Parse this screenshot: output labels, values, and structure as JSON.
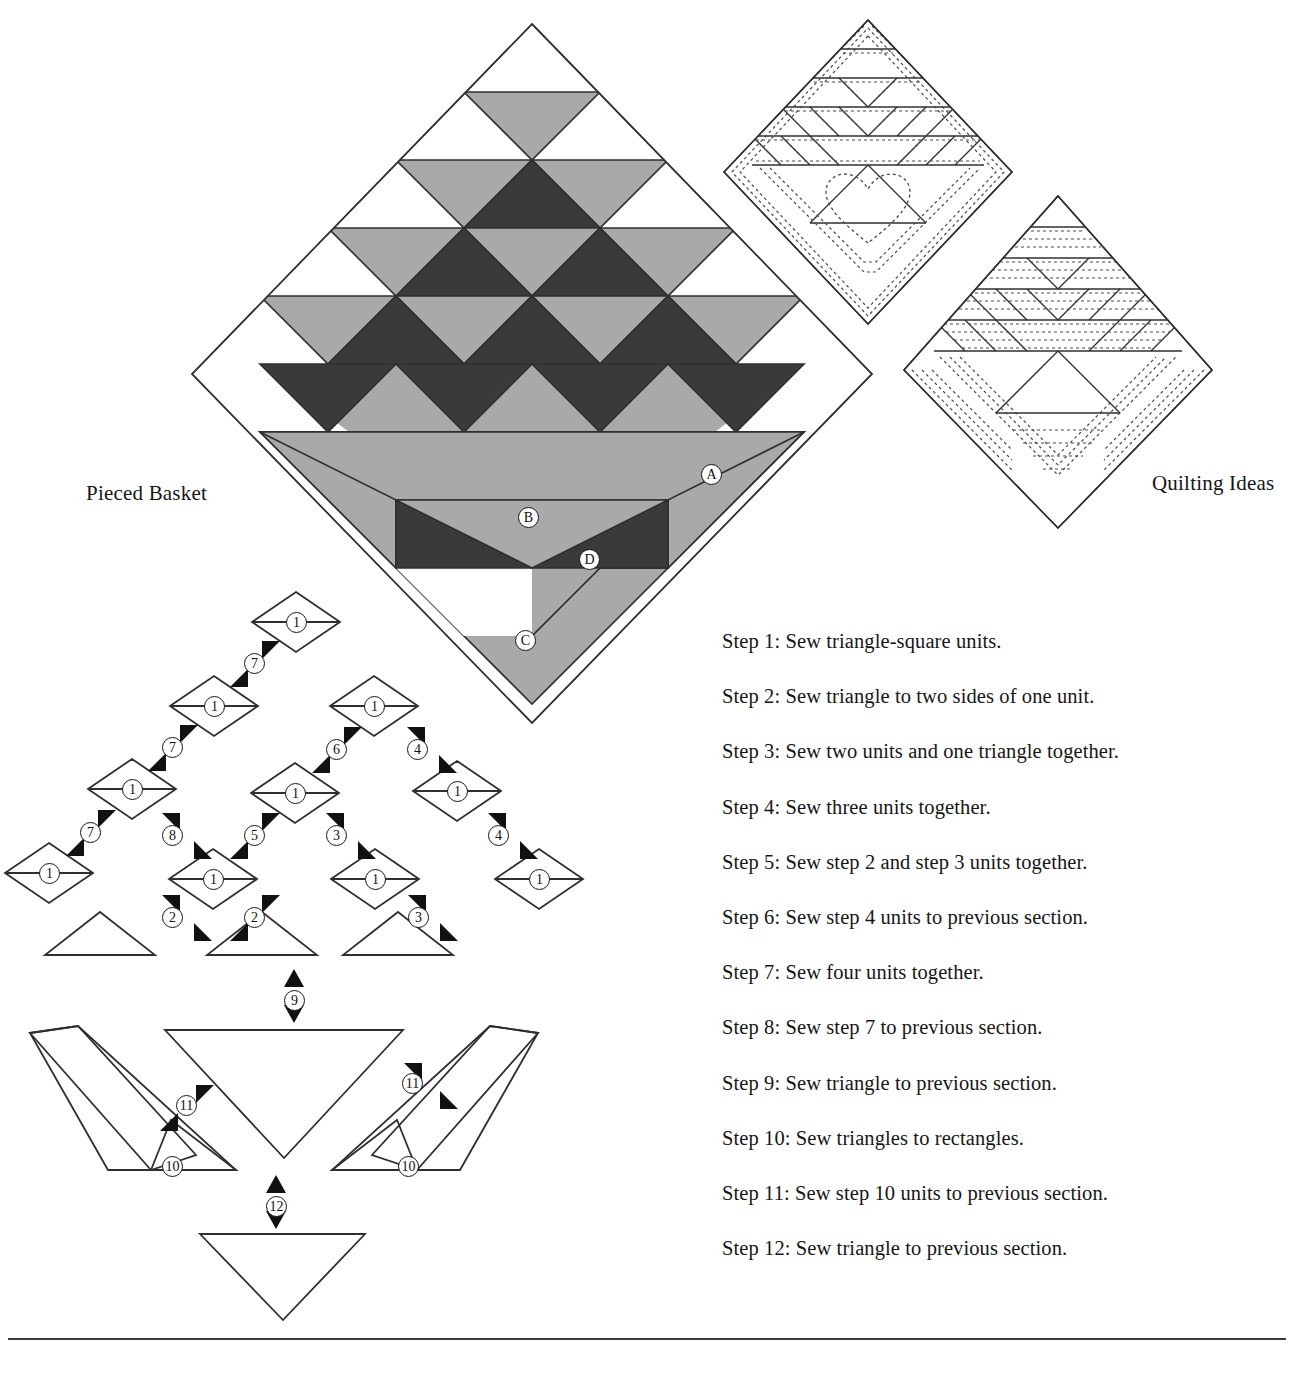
{
  "page": {
    "background": "#ffffff",
    "ink": "#161616"
  },
  "labels": {
    "pieced_basket": "Pieced Basket",
    "quilting_ideas": "Quilting Ideas"
  },
  "block_patch_labels": [
    {
      "id": "A",
      "text": "A",
      "x": 708,
      "y": 465,
      "note": "background corner triangle"
    },
    {
      "id": "B",
      "text": "B",
      "x": 521,
      "y": 508,
      "note": "large light basket triangle"
    },
    {
      "id": "C",
      "text": "C",
      "x": 521,
      "y": 633,
      "note": "bottom background triangle"
    },
    {
      "id": "D",
      "text": "D",
      "x": 586,
      "y": 551,
      "note": "dark basket foot triangle"
    }
  ],
  "colors": {
    "light_fabric": "#a9a9a9",
    "dark_fabric": "#3a3a3a",
    "background_fabric": "#ffffff",
    "outline": "#2f2f2f",
    "quilting_dash": "#4a4a4a"
  },
  "steps": [
    {
      "n": 1,
      "label": "Step 1: Sew triangle-square units."
    },
    {
      "n": 2,
      "label": "Step 2: Sew triangle to two sides of one unit."
    },
    {
      "n": 3,
      "label": "Step 3: Sew two units and one triangle together."
    },
    {
      "n": 4,
      "label": "Step 4: Sew three units together."
    },
    {
      "n": 5,
      "label": "Step 5: Sew step 2 and step 3 units together."
    },
    {
      "n": 6,
      "label": "Step 6: Sew step 4 units to previous section."
    },
    {
      "n": 7,
      "label": "Step 7: Sew four units together."
    },
    {
      "n": 8,
      "label": "Step 8: Sew step 7 to previous section."
    },
    {
      "n": 9,
      "label": "Step 9: Sew triangle to previous section."
    },
    {
      "n": 10,
      "label": "Step 10: Sew triangles to rectangles."
    },
    {
      "n": 11,
      "label": "Step 11: Sew step 10 units to previous section."
    },
    {
      "n": 12,
      "label": "Step 12: Sew triangle to previous section."
    }
  ],
  "assembly": {
    "unit_label": "1",
    "units": [
      {
        "id": "u1",
        "x": 296,
        "y": 622
      },
      {
        "id": "u2",
        "x": 214,
        "y": 706
      },
      {
        "id": "u3",
        "x": 132,
        "y": 789
      },
      {
        "id": "u4",
        "x": 49,
        "y": 873
      },
      {
        "id": "u5",
        "x": 213,
        "y": 879
      },
      {
        "id": "u6",
        "x": 295,
        "y": 793
      },
      {
        "id": "u7",
        "x": 374,
        "y": 706
      },
      {
        "id": "u8",
        "x": 457,
        "y": 791
      },
      {
        "id": "u9",
        "x": 375,
        "y": 879
      },
      {
        "id": "u10",
        "x": 539,
        "y": 879
      }
    ],
    "seam_markers": [
      {
        "step": "7",
        "x": 254,
        "y": 663
      },
      {
        "step": "7",
        "x": 172,
        "y": 747
      },
      {
        "step": "7",
        "x": 90,
        "y": 832
      },
      {
        "step": "8",
        "x": 172,
        "y": 835
      },
      {
        "step": "2",
        "x": 172,
        "y": 917
      },
      {
        "step": "2",
        "x": 254,
        "y": 917
      },
      {
        "step": "5",
        "x": 254,
        "y": 835
      },
      {
        "step": "6",
        "x": 336,
        "y": 749
      },
      {
        "step": "3",
        "x": 336,
        "y": 835
      },
      {
        "step": "3",
        "x": 418,
        "y": 917
      },
      {
        "step": "4",
        "x": 417,
        "y": 749
      },
      {
        "step": "4",
        "x": 498,
        "y": 835
      },
      {
        "step": "9",
        "x": 294,
        "y": 1000
      },
      {
        "step": "11",
        "x": 186,
        "y": 1105
      },
      {
        "step": "11",
        "x": 412,
        "y": 1083
      },
      {
        "step": "10",
        "x": 172,
        "y": 1166
      },
      {
        "step": "10",
        "x": 408,
        "y": 1166
      },
      {
        "step": "12",
        "x": 276,
        "y": 1206
      }
    ],
    "loose_triangles": [
      {
        "id": "t1",
        "x": 100,
        "y": 912
      },
      {
        "id": "t2",
        "x": 262,
        "y": 912
      },
      {
        "id": "t3",
        "x": 398,
        "y": 912
      }
    ],
    "big_triangle": {
      "id": "basket-body",
      "x": 165,
      "y": 1026
    },
    "foot_triangle": {
      "id": "base-triangle",
      "x": 200,
      "y": 1230
    },
    "rectangles": [
      {
        "id": "handle-left",
        "side": "left"
      },
      {
        "id": "handle-right",
        "side": "right"
      }
    ]
  },
  "block": {
    "center_x": 532,
    "center_y": 374,
    "half_diagonal": 340,
    "grid_rows": 5,
    "triangle_rows": [
      {
        "row": 1,
        "up": [
          "bg"
        ],
        "down": [
          "light"
        ]
      },
      {
        "row": 2,
        "up": [
          "bg",
          "light"
        ],
        "down": [
          "light",
          "dark",
          "light"
        ]
      },
      {
        "row": 3,
        "up": [
          "bg",
          "light",
          "dark",
          "light"
        ],
        "down": [
          "light",
          "dark",
          "light",
          "dark",
          "light"
        ]
      },
      {
        "row": 4,
        "up": [
          "light",
          "dark",
          "light",
          "dark",
          "light",
          "dark"
        ],
        "down": [
          "light",
          "dark",
          "light",
          "dark",
          "light",
          "dark",
          "light"
        ]
      }
    ]
  },
  "quilting": {
    "diagram_one": {
      "id": "quilting-heart-block",
      "motif": "heart",
      "style": "outline quilting"
    },
    "diagram_two": {
      "id": "quilting-lines-block",
      "motif": "parallel lines",
      "style": "echo and line quilting"
    }
  }
}
